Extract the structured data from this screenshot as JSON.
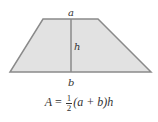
{
  "diagram": {
    "shape": "trapezoid",
    "colors": {
      "fill": "#e2e2e2",
      "stroke": "#8a8a8a",
      "text": "#333333"
    },
    "vertices": {
      "top_left": [
        43,
        19
      ],
      "top_right": [
        98,
        19
      ],
      "bottom_right": [
        151,
        72
      ],
      "bottom_left": [
        10,
        72
      ]
    },
    "height_line": {
      "x": 71,
      "y1": 19,
      "y2": 72
    },
    "labels": {
      "top": "a",
      "height": "h",
      "bottom": "b"
    }
  },
  "formula": {
    "lhs": "A",
    "equals": "=",
    "frac_num": "1",
    "frac_den": "2",
    "rhs": "(a + b)h"
  }
}
